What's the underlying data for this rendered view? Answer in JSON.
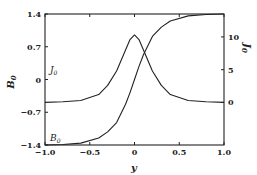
{
  "chart_data": {
    "type": "line",
    "title": "",
    "xlabel": "y",
    "ylabel_left": "B0",
    "ylabel_right": "J0",
    "xlim": [
      -1.0,
      1.0
    ],
    "ylim_left": [
      -1.4,
      1.4
    ],
    "ylim_right": [
      -6.5,
      13.5
    ],
    "x_ticks": [
      "-1.0",
      "-0.5",
      "0",
      "0.5",
      "1.0"
    ],
    "y_ticks_left": [
      "-1.4",
      "-0.7",
      "0",
      "0.7",
      "1.4"
    ],
    "y_ticks_right": [
      "0",
      "5",
      "10"
    ],
    "grid": false,
    "legend": "inline curve labels",
    "series": [
      {
        "name": "B0",
        "label": "B0",
        "axis": "left",
        "x": [
          -1.0,
          -0.8,
          -0.6,
          -0.4,
          -0.3,
          -0.2,
          -0.1,
          -0.05,
          0.0,
          0.05,
          0.1,
          0.2,
          0.3,
          0.4,
          0.6,
          0.8,
          1.0
        ],
        "values": [
          -1.4,
          -1.39,
          -1.36,
          -1.25,
          -1.12,
          -0.92,
          -0.53,
          -0.28,
          0.0,
          0.28,
          0.53,
          0.92,
          1.12,
          1.25,
          1.36,
          1.39,
          1.4
        ]
      },
      {
        "name": "J0",
        "label": "J0",
        "axis": "right",
        "x": [
          -1.0,
          -0.8,
          -0.6,
          -0.4,
          -0.3,
          -0.2,
          -0.1,
          -0.05,
          0.0,
          0.05,
          0.1,
          0.2,
          0.3,
          0.4,
          0.6,
          0.8,
          1.0
        ],
        "values": [
          0.0,
          0.1,
          0.3,
          1.2,
          2.6,
          4.8,
          8.0,
          9.6,
          10.3,
          9.6,
          8.0,
          4.8,
          2.6,
          1.2,
          0.3,
          0.1,
          0.0
        ]
      }
    ]
  },
  "labels": {
    "xlabel": "y",
    "ylabel_left": "B",
    "ylabel_left_sub": "0",
    "ylabel_right": "J",
    "ylabel_right_sub": "0",
    "curve_b": "B",
    "curve_b_sub": "0",
    "curve_j": "J",
    "curve_j_sub": "0"
  }
}
